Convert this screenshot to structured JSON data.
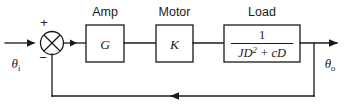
{
  "diagram": {
    "type": "control-system-block-diagram",
    "title": "",
    "input_signal": {
      "symbol": "θ",
      "subscript": "i"
    },
    "output_signal": {
      "symbol": "θ",
      "subscript": "o"
    },
    "summing_junction": {
      "name": "summing-junction",
      "style": "crossed-circle",
      "positive_sign": "+",
      "negative_sign": "−"
    },
    "blocks": [
      {
        "caption": "Amp",
        "label": "G",
        "kind": "gain"
      },
      {
        "caption": "Motor",
        "label": "K",
        "kind": "gain"
      },
      {
        "caption": "Load",
        "kind": "transfer-function",
        "numerator": "1",
        "denominator_base": "JD",
        "denominator_exponent": "2",
        "denominator_tail": " + cD",
        "denominator_full": "JD2 + cD"
      }
    ],
    "feedback": {
      "name": "feedback-path",
      "direction": "right-to-left",
      "gain": "1",
      "sign": "negative"
    }
  }
}
